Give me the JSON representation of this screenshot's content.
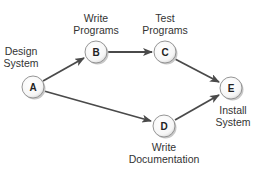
{
  "diagram": {
    "type": "activity-on-node network",
    "colors": {
      "edge": "#4a4a4a",
      "node_fill": "#ffffff",
      "node_stroke": "#8a8a8a",
      "node_shadow": "#c8c8c8",
      "text": "#333333"
    },
    "nodes": [
      {
        "id": "A",
        "letter": "A",
        "label_line1": "Design",
        "label_line2": "System",
        "cx": 33,
        "cy": 87
      },
      {
        "id": "B",
        "letter": "B",
        "label_line1": "Write",
        "label_line2": "Programs",
        "cx": 96,
        "cy": 52
      },
      {
        "id": "C",
        "letter": "C",
        "label_line1": "Test",
        "label_line2": "Programs",
        "cx": 165,
        "cy": 52
      },
      {
        "id": "D",
        "letter": "D",
        "label_line1": "Write",
        "label_line2": "Documentation",
        "cx": 164,
        "cy": 126
      },
      {
        "id": "E",
        "letter": "E",
        "label_line1": "Install",
        "label_line2": "System",
        "cx": 231,
        "cy": 88
      }
    ],
    "edges": [
      {
        "from": "A",
        "to": "B"
      },
      {
        "from": "B",
        "to": "C"
      },
      {
        "from": "C",
        "to": "E"
      },
      {
        "from": "A",
        "to": "D"
      },
      {
        "from": "D",
        "to": "E"
      }
    ]
  }
}
